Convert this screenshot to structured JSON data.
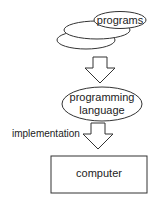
{
  "diagram": {
    "nodes": {
      "programs": {
        "label": "programs",
        "shape": "stacked-ellipses"
      },
      "language": {
        "line1": "programming",
        "line2": "language",
        "shape": "ellipse"
      },
      "computer": {
        "label": "computer",
        "shape": "rectangle"
      }
    },
    "edges": [
      {
        "from": "programs",
        "to": "language",
        "label": ""
      },
      {
        "from": "language",
        "to": "computer",
        "label": "implementation"
      }
    ],
    "colors": {
      "stroke": "#333333",
      "text": "#222222",
      "background": "#ffffff"
    }
  }
}
